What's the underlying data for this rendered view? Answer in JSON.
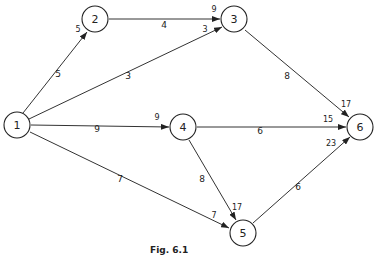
{
  "caption": "Fig. 6.1",
  "nodes": [
    {
      "id": "1",
      "x": 17,
      "y": 125
    },
    {
      "id": "2",
      "x": 95,
      "y": 20
    },
    {
      "id": "3",
      "x": 234,
      "y": 20
    },
    {
      "id": "4",
      "x": 183,
      "y": 127
    },
    {
      "id": "5",
      "x": 243,
      "y": 233
    },
    {
      "id": "6",
      "x": 360,
      "y": 127
    }
  ],
  "edges": [
    {
      "from": "1",
      "to": "2",
      "duration": "5"
    },
    {
      "from": "1",
      "to": "3",
      "duration": "3"
    },
    {
      "from": "1",
      "to": "4",
      "duration": "9"
    },
    {
      "from": "1",
      "to": "5",
      "duration": "7"
    },
    {
      "from": "2",
      "to": "3",
      "duration": "4"
    },
    {
      "from": "3",
      "to": "6",
      "duration": "8"
    },
    {
      "from": "4",
      "to": "6",
      "duration": "6"
    },
    {
      "from": "4",
      "to": "5",
      "duration": "8"
    },
    {
      "from": "5",
      "to": "6",
      "duration": "6"
    }
  ],
  "arrival_labels": [
    {
      "at": "2",
      "via": "1-2",
      "value": "5"
    },
    {
      "at": "3",
      "via": "2-3",
      "value": "9"
    },
    {
      "at": "3",
      "via": "1-3",
      "value": "3"
    },
    {
      "at": "4",
      "via": "1-4",
      "value": "9"
    },
    {
      "at": "5",
      "via": "1-5",
      "value": "7"
    },
    {
      "at": "5",
      "via": "4-5",
      "value": "17"
    },
    {
      "at": "6",
      "via": "3-6",
      "value": "17"
    },
    {
      "at": "6",
      "via": "4-6",
      "value": "15"
    },
    {
      "at": "6",
      "via": "5-6",
      "value": "23"
    }
  ]
}
